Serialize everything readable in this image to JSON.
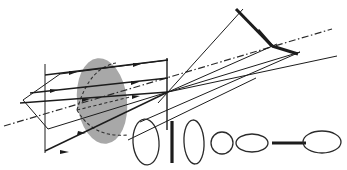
{
  "figure": {
    "caption": "",
    "width": 347,
    "height": 170,
    "background_color": "#ffffff"
  },
  "colors": {
    "ray_stroke": "#1c1c1c",
    "lens_fill": "#a8a8a8",
    "axis_stroke": "#2a2a2a",
    "dashed_stroke": "#2f2f2f",
    "shape_stroke": "#2b2b2b"
  },
  "elements": {
    "lens": {
      "name": "lens-aperture-ellipse",
      "cx": 102,
      "cy": 101,
      "rx": 25,
      "ry": 43,
      "rotation": -6,
      "fill": "#a8a8a8"
    },
    "optical_axis": {
      "name": "optical-axis",
      "style": "dash-dot",
      "x1": 4,
      "y1": 126,
      "x2": 332,
      "y2": 29
    },
    "object_plane": {
      "name": "object-plane-vertical-line",
      "x": 45,
      "y1": 64,
      "y2": 153
    },
    "image_plane": {
      "name": "image-plane-vertical-line",
      "x": 167,
      "y1": 58,
      "y2": 130
    },
    "incoming_rays": [
      {
        "name": "ray-upper",
        "x1": 46,
        "y1": 75,
        "x2": 168,
        "y2": 60
      },
      {
        "name": "ray-middle",
        "x1": 22,
        "y1": 101,
        "x2": 168,
        "y2": 92
      },
      {
        "name": "ray-lower",
        "x1": 46,
        "y1": 147,
        "x2": 168,
        "y2": 92
      }
    ],
    "outgoing_rays": [
      {
        "name": "ray-out-upper",
        "x1": 168,
        "y1": 92,
        "x2": 310,
        "y2": 45
      },
      {
        "name": "ray-out-lower",
        "x1": 168,
        "y1": 92,
        "x2": 337,
        "y2": 55
      }
    ],
    "focus_point": {
      "name": "focal-convergence-point",
      "x": 168,
      "y": 92
    },
    "second_focus_point": {
      "name": "secondary-crossing-point",
      "x": 272,
      "y": 46
    },
    "arrow_count": 6
  },
  "cross_sections": {
    "label": "beam-cross-section-series",
    "count": 7,
    "shapes": [
      {
        "index": 1,
        "name": "cross-section-tall-ellipse-1",
        "type": "ellipse",
        "cx": 146,
        "cy": 142,
        "rx": 13,
        "ry": 23
      },
      {
        "index": 2,
        "name": "cross-section-vertical-bar",
        "type": "line-vertical",
        "cx": 172,
        "cy": 142,
        "half_length": 21
      },
      {
        "index": 3,
        "name": "cross-section-tall-ellipse-2",
        "type": "ellipse",
        "cx": 194,
        "cy": 142,
        "rx": 10,
        "ry": 22
      },
      {
        "index": 4,
        "name": "cross-section-circle",
        "type": "ellipse",
        "cx": 222,
        "cy": 143,
        "rx": 11,
        "ry": 11
      },
      {
        "index": 5,
        "name": "cross-section-wide-ellipse-1",
        "type": "ellipse",
        "cx": 252,
        "cy": 143,
        "rx": 16,
        "ry": 9
      },
      {
        "index": 6,
        "name": "cross-section-horizontal-bar",
        "type": "line-horizontal",
        "cx": 289,
        "cy": 143,
        "half_length": 17
      },
      {
        "index": 7,
        "name": "cross-section-wide-ellipse-2",
        "type": "ellipse",
        "cx": 322,
        "cy": 142,
        "rx": 19,
        "ry": 11
      }
    ]
  },
  "chart_data": {
    "type": "scatter",
    "xlabel": "",
    "ylabel": "",
    "grid": false,
    "legend": false,
    "annotations": [
      "gray elliptical lens aperture",
      "dash-dot optical axis",
      "three incoming parallel rays with arrowheads",
      "converging cone after lens",
      "seven beam cross-section outlines below"
    ]
  }
}
